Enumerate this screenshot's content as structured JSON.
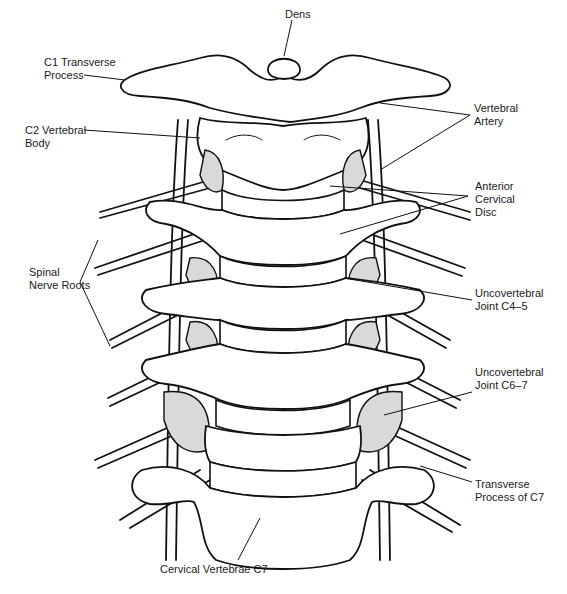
{
  "figure": {
    "labels": {
      "dens": "Dens",
      "c1_transverse_process": "C1 Transverse\nProcess",
      "c2_vertebral_body": "C2 Vertebral\nBody",
      "vertebral_artery": "Vertebral\nArtery",
      "anterior_cervical_disc": "Anterior\nCervical\nDisc",
      "spinal_nerve_roots": "Spinal\nNerve Roots",
      "uncovertebral_joint_c45": "Uncovertebral\nJoint C4–5",
      "uncovertebral_joint_c67": "Uncovertebral\nJoint C6–7",
      "transverse_process_c7": "Transverse\nProcess of C7",
      "cervical_vertebrae_c7": "Cervical Vertebrae C7"
    },
    "colors": {
      "ink": "#111111",
      "background": "#ffffff",
      "stipple": "#d9d9d9"
    }
  }
}
